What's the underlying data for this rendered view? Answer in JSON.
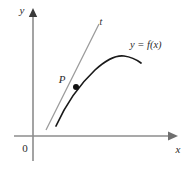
{
  "figure": {
    "background_color": "#ffffff",
    "width": 195,
    "height": 171
  },
  "axes": {
    "x_axis": {
      "label": "x",
      "color": "#8c8c8c",
      "arrow": "right-arrow-icon",
      "y_position": 136,
      "x_start": 14,
      "x_end": 176
    },
    "y_axis": {
      "label": "y",
      "color": "#8c8c8c",
      "arrow": "up-arrow-icon",
      "x_position": 33,
      "y_start": 160,
      "y_end": 12
    },
    "origin": {
      "label": "0",
      "x": 25,
      "y": 150
    }
  },
  "curve": {
    "label": "y = f(x)",
    "color": "#1a1a1a",
    "label_x": 130,
    "label_y": 48,
    "path": "M 56,126 C 66,104 78,86 95,70 C 106,60 116,55 124,56 C 132,57 137,60 141,63"
  },
  "tangent": {
    "label": "t",
    "color": "#9a9a9a",
    "label_x": 101,
    "label_y": 25,
    "x1": 46,
    "y1": 130,
    "x2": 99,
    "y2": 24
  },
  "point": {
    "label": "P",
    "color": "#111111",
    "x": 76,
    "y": 87,
    "label_x": 62,
    "label_y": 83,
    "radius": 3
  },
  "colors": {
    "axis": "#8c8c8c",
    "curve": "#1a1a1a",
    "tangent": "#9a9a9a",
    "text": "#2b2b2b",
    "point": "#111111"
  }
}
